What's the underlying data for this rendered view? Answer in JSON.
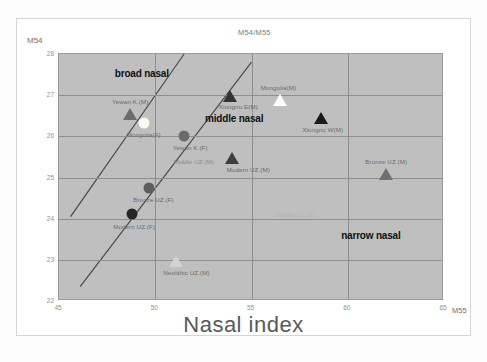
{
  "chart_data": {
    "type": "scatter",
    "title": "M54/M55",
    "xlabel": "M55",
    "xlabel_big": "Nasal index",
    "ylabel": "M54",
    "xlim": [
      45,
      65
    ],
    "ylim": [
      22,
      28
    ],
    "xticks": [
      "45",
      "50",
      "55",
      "60",
      "65"
    ],
    "yticks": [
      "28",
      "27",
      "26",
      "25",
      "24",
      "23",
      "22"
    ],
    "grid": true,
    "legend": "none",
    "zones": [
      {
        "label": "broad nasal",
        "x": 49.3,
        "y": 27.55
      },
      {
        "label": "middle nasal",
        "x": 54.1,
        "y": 26.45
      },
      {
        "label": "narrow nasal",
        "x": 61.2,
        "y": 23.6
      }
    ],
    "boundary_lines": [
      {
        "name": "broad-middle-boundary",
        "x1": 45.6,
        "y1": 24.05,
        "x2": 51.5,
        "y2": 28.0
      },
      {
        "name": "middle-narrow-boundary",
        "x1": 46.1,
        "y1": 22.35,
        "x2": 55.0,
        "y2": 27.8
      }
    ],
    "points": [
      {
        "label": "Yewan K.(M)",
        "x": 48.7,
        "y": 26.55,
        "marker": "triangle",
        "color": "#6b6b6b",
        "label_dx": 0,
        "label_dy": -16
      },
      {
        "label": "Mongolia(F)",
        "x": 49.4,
        "y": 26.33,
        "marker": "circle",
        "color": "#fbfbf2",
        "label_dx": 0,
        "label_dy": 8
      },
      {
        "label": "Yewan K.(F)",
        "x": 51.5,
        "y": 26.0,
        "marker": "circle",
        "color": "#6b6b6b",
        "label_dx": 6,
        "label_dy": 8
      },
      {
        "label": "Xiongnu E(M)",
        "x": 53.9,
        "y": 26.98,
        "marker": "triangle",
        "color": "#333333",
        "label_dx": 8,
        "label_dy": 7
      },
      {
        "label": "Mongolia(M)",
        "x": 56.5,
        "y": 26.88,
        "marker": "triangle",
        "color": "#ffffff",
        "label_dx": -2,
        "label_dy": -16
      },
      {
        "label": "Xiongnu W(M)",
        "x": 58.6,
        "y": 26.45,
        "marker": "triangle",
        "color": "#1a1a1a",
        "label_dx": 2,
        "label_dy": 8
      },
      {
        "label": "Middle UZ.(M)",
        "x": 52.0,
        "y": 25.48,
        "marker": "none",
        "color": "#8c8c8c",
        "label_dx": 0,
        "label_dy": 0
      },
      {
        "label": "Modern UZ.(M)",
        "x": 54.0,
        "y": 25.47,
        "marker": "triangle",
        "color": "#3d3d3d",
        "label_dx": 16,
        "label_dy": 8
      },
      {
        "label": "Bronze UZ.(M)",
        "x": 62.0,
        "y": 25.08,
        "marker": "triangle",
        "color": "#6f6f6f",
        "label_dx": 0,
        "label_dy": -16
      },
      {
        "label": "Bronze UZ.(F)",
        "x": 49.7,
        "y": 24.75,
        "marker": "circle",
        "color": "#5e5e5e",
        "label_dx": 4,
        "label_dy": 8
      },
      {
        "label": "Modern UZ.(F)",
        "x": 48.8,
        "y": 24.12,
        "marker": "circle",
        "color": "#262626",
        "label_dx": 2,
        "label_dy": 9
      },
      {
        "label": "Middle UZ.(F)",
        "x": 57.3,
        "y": 24.45,
        "marker": "none",
        "color": "#b3b3b3",
        "label_dx": 0,
        "label_dy": 11
      },
      {
        "label": "Neolithic UZ.(M)",
        "x": 51.1,
        "y": 22.98,
        "marker": "triangle",
        "color": "#d2d2d2",
        "label_dx": 10,
        "label_dy": 8
      }
    ]
  },
  "caption": {
    "text": ""
  }
}
